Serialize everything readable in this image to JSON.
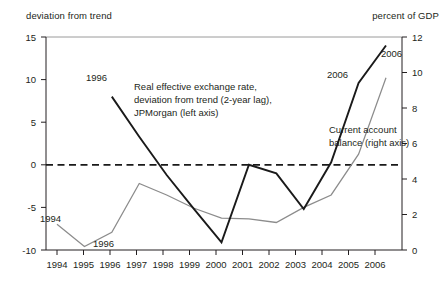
{
  "captions": {
    "left_axis_caption": "deviation from trend",
    "right_axis_caption": "percent of GDP"
  },
  "chart_data": {
    "type": "line",
    "title": "",
    "subtitle": "",
    "xlabel": "",
    "ylabel": "deviation from trend",
    "y2label": "percent of GDP",
    "grid": false,
    "legend_position": "inline-annotations",
    "x": [
      1994,
      1995,
      1996,
      1997,
      1998,
      1999,
      2000,
      2001,
      2002,
      2003,
      2004,
      2005,
      2006
    ],
    "xticklabels": [
      "1994",
      "1995",
      "1996",
      "1997",
      "1998",
      "1999",
      "2000",
      "2001",
      "2002",
      "2003",
      "2004",
      "2005",
      "2006"
    ],
    "ylim": [
      -10,
      15
    ],
    "yticks": [
      -10,
      -5,
      0,
      5,
      10,
      15
    ],
    "yticklabels": [
      "-10",
      "-5",
      "0",
      "5",
      "10",
      "15"
    ],
    "y2lim": [
      0,
      12
    ],
    "y2ticks": [
      0,
      2,
      4,
      6,
      8,
      10,
      12
    ],
    "y2ticklabels": [
      "0",
      "2",
      "4",
      "6",
      "8",
      "10",
      "12"
    ],
    "zero_reference_line": 0,
    "series": [
      {
        "name": "Real effective exchange rate, deviation from trend (2-year lag), JPMorgan (left axis)",
        "axis": "left",
        "color": "#1a1a1a",
        "x": [
          1996,
          1997,
          1998,
          1999,
          2000,
          2001,
          2002,
          2003,
          2004,
          2005,
          2006
        ],
        "values": [
          8.0,
          3.3,
          -1.2,
          -5.2,
          -9.1,
          0.0,
          -1.0,
          -5.2,
          0.3,
          9.6,
          14.0
        ]
      },
      {
        "name": "Current account balance (right axis)",
        "axis": "right",
        "color": "#8c8c8c",
        "x": [
          1994,
          1995,
          1996,
          1997,
          1998,
          1999,
          2000,
          2001,
          2002,
          2003,
          2004,
          2005,
          2006
        ],
        "values": [
          1.45,
          0.2,
          1.0,
          3.75,
          3.1,
          2.35,
          1.8,
          1.75,
          1.55,
          2.4,
          3.1,
          5.4,
          9.7
        ]
      }
    ],
    "annotations": [
      {
        "text": "1994",
        "series": "Current account balance (right axis)",
        "at_x": 1994
      },
      {
        "text": "1996",
        "series": "Current account balance (right axis)",
        "at_x": 1996
      },
      {
        "text": "2006",
        "series": "Current account balance (right axis)",
        "at_x": 2006
      },
      {
        "text": "1996",
        "series": "Real effective exchange rate, deviation from trend (2-year lag), JPMorgan (left axis)",
        "at_x": 1996
      },
      {
        "text": "2006",
        "series": "Real effective exchange rate, deviation from trend (2-year lag), JPMorgan (left axis)",
        "at_x": 2006
      }
    ],
    "inline_labels": {
      "reer_line1": "Real effective exchange rate,",
      "reer_line2": "deviation from trend (2-year lag),",
      "reer_line3": "JPMorgan (left axis)",
      "cab_line1": "Current account",
      "cab_line2": "balance (right axis)"
    },
    "point_markers": {
      "reer_1996": "1996",
      "reer_2006": "2006",
      "cab_1994": "1994",
      "cab_1996": "1996",
      "cab_2006": "2006"
    }
  },
  "colors": {
    "reer_series": "#1a1a1a",
    "cab_series": "#8c8c8c",
    "axis": "#231f20",
    "top_rule": "#9a9a9a",
    "background": "#ffffff"
  }
}
